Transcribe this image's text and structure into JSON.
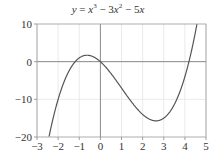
{
  "chart_data": {
    "type": "line",
    "function": "x^3 - 3x^2 - 5x",
    "xlabel": "",
    "ylabel": "",
    "xlim": [
      -3,
      5
    ],
    "ylim": [
      -20,
      10
    ],
    "x_ticks": [
      -3,
      -2,
      -1,
      0,
      1,
      2,
      3,
      4,
      5
    ],
    "x_tick_labels": [
      "−3",
      "−2",
      "−1",
      "0",
      "1",
      "2",
      "3",
      "4",
      "5"
    ],
    "y_ticks": [
      -20,
      -10,
      0,
      10
    ],
    "y_tick_labels": [
      "−20",
      "−10",
      "0",
      "10"
    ],
    "grid": true,
    "axes_lines_at_zero": true,
    "series": [
      {
        "name": "y = x³ − 3x² − 5x",
        "x": [
          -2.3,
          -2.0,
          -1.5,
          -1.0,
          -0.633,
          0.0,
          0.5,
          1.0,
          1.5,
          2.0,
          2.633,
          3.0,
          3.5,
          4.0,
          4.19,
          4.55
        ],
        "y": [
          -19.7,
          -14.0,
          -2.6,
          1.0,
          1.76,
          0.0,
          -3.125,
          -7.0,
          -10.9,
          -14.0,
          -15.76,
          -15.0,
          -11.4,
          -4.0,
          0.0,
          10.0
        ]
      }
    ],
    "key_points": {
      "roots": [
        -1.19,
        0,
        4.19
      ],
      "local_max": [
        -0.633,
        1.76
      ],
      "local_min": [
        2.633,
        -15.76
      ]
    }
  },
  "title_parts": {
    "lhs": "y",
    "eq": " = ",
    "term1": "x",
    "exp1": "3",
    "minus1": " − 3",
    "term2": "x",
    "exp2": "2",
    "minus2": " − 5",
    "term3": "x"
  },
  "colors": {
    "curve": "#555555",
    "axis": "#888888",
    "grid": "#e4e4e4",
    "frame": "#999999",
    "text": "#333333"
  }
}
